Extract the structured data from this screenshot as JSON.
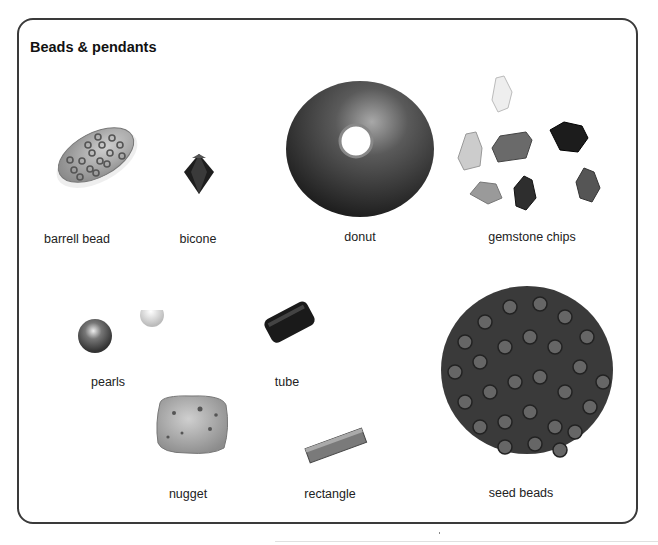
{
  "title": "Beads & pendants",
  "items": [
    {
      "id": "barrell-bead",
      "label": "barrell bead"
    },
    {
      "id": "bicone",
      "label": "bicone"
    },
    {
      "id": "donut",
      "label": "donut"
    },
    {
      "id": "gemstone-chips",
      "label": "gemstone chips"
    },
    {
      "id": "pearls",
      "label": "pearls"
    },
    {
      "id": "tube",
      "label": "tube"
    },
    {
      "id": "seed-beads",
      "label": "seed beads"
    },
    {
      "id": "nugget",
      "label": "nugget"
    },
    {
      "id": "rectangle",
      "label": "rectangle"
    }
  ],
  "colors": {
    "frame": "#3a3a3a",
    "text": "#222222",
    "background": "#ffffff"
  }
}
